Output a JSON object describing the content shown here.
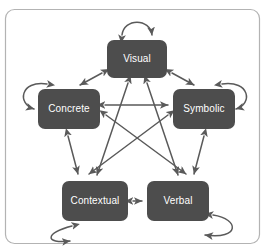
{
  "diagram": {
    "frame": {
      "stroke_color": "#b3b3b3",
      "fill_color": "#ffffff"
    },
    "node_style": {
      "fill_color": "#4d4d4d",
      "text_color": "#ffffff"
    },
    "arrow_style": {
      "stroke_color": "#5a5a5a"
    },
    "nodes": [
      {
        "id": "visual",
        "label": "Visual",
        "position": "top"
      },
      {
        "id": "concrete",
        "label": "Concrete",
        "position": "left"
      },
      {
        "id": "symbolic",
        "label": "Symbolic",
        "position": "right"
      },
      {
        "id": "contextual",
        "label": "Contextual",
        "position": "bottom-left"
      },
      {
        "id": "verbal",
        "label": "Verbal",
        "position": "bottom-right"
      }
    ],
    "edges": [
      {
        "from": "visual",
        "to": "concrete",
        "type": "bidirectional"
      },
      {
        "from": "visual",
        "to": "symbolic",
        "type": "bidirectional"
      },
      {
        "from": "concrete",
        "to": "symbolic",
        "type": "bidirectional"
      },
      {
        "from": "concrete",
        "to": "contextual",
        "type": "bidirectional"
      },
      {
        "from": "symbolic",
        "to": "verbal",
        "type": "bidirectional"
      },
      {
        "from": "contextual",
        "to": "verbal",
        "type": "bidirectional"
      },
      {
        "from": "visual",
        "to": "contextual",
        "type": "bidirectional"
      },
      {
        "from": "visual",
        "to": "verbal",
        "type": "bidirectional"
      },
      {
        "from": "concrete",
        "to": "verbal",
        "type": "bidirectional"
      },
      {
        "from": "symbolic",
        "to": "contextual",
        "type": "bidirectional"
      }
    ],
    "self_loops": [
      {
        "node": "visual",
        "side": "top"
      },
      {
        "node": "concrete",
        "side": "left"
      },
      {
        "node": "symbolic",
        "side": "right"
      },
      {
        "node": "contextual",
        "side": "bottom"
      },
      {
        "node": "verbal",
        "side": "bottom-right"
      }
    ]
  }
}
